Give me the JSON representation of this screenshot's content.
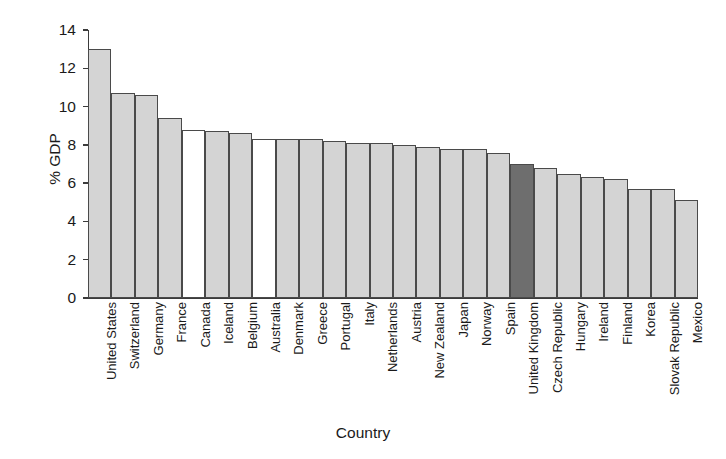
{
  "chart_data": {
    "type": "bar",
    "title": "",
    "subtitle": "",
    "xlabel": "Country",
    "ylabel": "% GDP",
    "ylim": [
      0,
      14
    ],
    "ytick_labels": [
      "0",
      "2",
      "4",
      "6",
      "8",
      "10",
      "12",
      "14"
    ],
    "ytick_values": [
      0,
      2,
      4,
      6,
      8,
      10,
      12,
      14
    ],
    "grid": false,
    "legend": null,
    "annotations": [
      "United Kingdom bar is shaded dark to highlight it"
    ],
    "bar_styles": {
      "default": "light-grey-fill",
      "highlight": "dark-grey-fill",
      "unfilled": "white-fill"
    },
    "colors": {
      "light": "#d4d4d4",
      "dark": "#6e6e6e",
      "white": "#ffffff",
      "outline": "#4a4a4a",
      "axis": "#3b3b3b"
    },
    "categories": [
      "United States",
      "Switzerland",
      "Germany",
      "France",
      "Canada",
      "Iceland",
      "Belgium",
      "Australia",
      "Denmark",
      "Greece",
      "Portugal",
      "Italy",
      "Netherlands",
      "Austria",
      "New Zealand",
      "Japan",
      "Norway",
      "Spain",
      "United Kingdom",
      "Czech Republic",
      "Hungary",
      "Ireland",
      "Finland",
      "Korea",
      "Slovak Republic",
      "Mexico"
    ],
    "values": [
      13.0,
      10.7,
      10.6,
      9.4,
      8.8,
      8.7,
      8.6,
      8.3,
      8.3,
      8.3,
      8.2,
      8.1,
      8.1,
      8.0,
      7.9,
      7.8,
      7.8,
      7.6,
      7.0,
      6.8,
      6.5,
      6.3,
      6.2,
      5.7,
      5.7,
      5.1
    ],
    "bar_fills": [
      "light",
      "light",
      "light",
      "light",
      "white",
      "light",
      "light",
      "white",
      "light",
      "light",
      "light",
      "light",
      "light",
      "light",
      "light",
      "light",
      "light",
      "light",
      "dark",
      "light",
      "light",
      "light",
      "light",
      "light",
      "light",
      "light"
    ]
  }
}
